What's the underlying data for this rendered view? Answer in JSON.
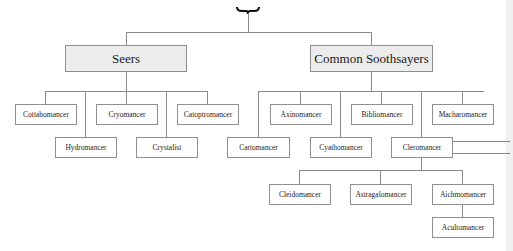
{
  "root": {
    "symbol": "brace"
  },
  "groups": [
    {
      "label": "Seers",
      "children": [
        "Cottabomancer",
        "Cryomancer",
        "Catoptromancer",
        "Hydromancer",
        "Crystalist"
      ]
    },
    {
      "label": "Common Soothsayers",
      "children": [
        "Axinomancer",
        "Bibliomancer",
        "Macharomancer",
        "Cartomancer",
        "Cyathomancer",
        "Cleromancer"
      ]
    }
  ],
  "cleromancer_children": [
    "Cleidomancer",
    "Astragalomancer",
    "Aichmomancer"
  ],
  "aichmomancer_children": [
    "Acultomancer"
  ],
  "colors": {
    "line": "#8a8a8a",
    "header_fill": "#ececec",
    "box_border": "#8f8f8f"
  }
}
